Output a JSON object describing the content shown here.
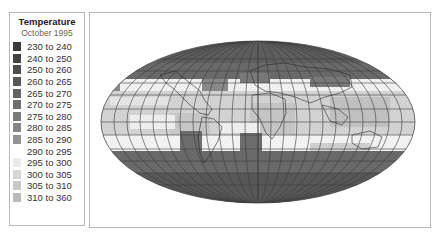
{
  "legend": {
    "title": "Temperature",
    "subtitle": "October 1995",
    "items": [
      {
        "label": "230 to 240",
        "color": "#3a3a3a"
      },
      {
        "label": "240 to 250",
        "color": "#444444"
      },
      {
        "label": "250 to 260",
        "color": "#4e4e4e"
      },
      {
        "label": "260 to 265",
        "color": "#585858"
      },
      {
        "label": "265 to 270",
        "color": "#636363"
      },
      {
        "label": "270 to 275",
        "color": "#6e6e6e"
      },
      {
        "label": "275 to 280",
        "color": "#7a7a7a"
      },
      {
        "label": "280 to 285",
        "color": "#868686"
      },
      {
        "label": "285 to 290",
        "color": "#939393"
      },
      {
        "label": "290 to 295",
        "color": "#ffffff"
      },
      {
        "label": "295 to 300",
        "color": "#ebebeb"
      },
      {
        "label": "300 to 305",
        "color": "#d6d6d6"
      },
      {
        "label": "305 to 310",
        "color": "#c8c8c8"
      },
      {
        "label": "310 to 360",
        "color": "#bababa"
      }
    ]
  },
  "map": {
    "projection": "Mollweide",
    "polar_color": "#5c5c5c",
    "mid_color": "#7c7c7c",
    "temperate_band_color": "#f4f4f4",
    "tropical_color": "#d2d2d2",
    "grid_color": "#3c3c3c"
  }
}
